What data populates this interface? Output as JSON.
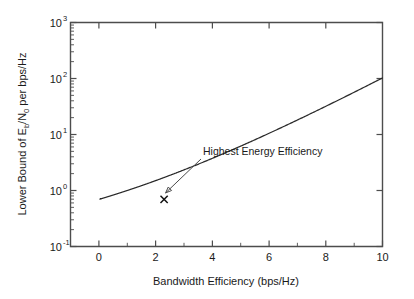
{
  "chart_data": {
    "type": "line",
    "title": "",
    "xlabel": "Bandwidth Efficiency (bps/Hz)",
    "ylabel_parts": {
      "pre": "Lower Bound of E",
      "sub1": "b",
      "mid": "/N",
      "sub2": "0",
      "post": " per bps/Hz"
    },
    "ylabel": "Lower Bound of Eb/N0 per bps/Hz",
    "xscale": "linear",
    "yscale": "log",
    "xlim": [
      -1,
      10
    ],
    "ylim": [
      0.1,
      1000
    ],
    "grid": false,
    "legend": null,
    "xticks": [
      0,
      2,
      4,
      6,
      8,
      10
    ],
    "xticklabels": [
      "0",
      "2",
      "4",
      "6",
      "8",
      "10"
    ],
    "xminorticks": [
      1,
      3,
      5,
      7,
      9
    ],
    "yticks": [
      0.1,
      1,
      10,
      100,
      1000
    ],
    "yticklabels": [
      {
        "base": "10",
        "exp": "-1"
      },
      {
        "base": "10",
        "exp": "0"
      },
      {
        "base": "10",
        "exp": "1"
      },
      {
        "base": "10",
        "exp": "2"
      },
      {
        "base": "10",
        "exp": "3"
      }
    ],
    "formula": "Eb/N0 = (2^eta - 1) / eta",
    "x": [
      0.04,
      0.06,
      0.08,
      0.1,
      0.13,
      0.16,
      0.2,
      0.25,
      0.3,
      0.36,
      0.42,
      0.5,
      0.6,
      0.7,
      0.8,
      0.9,
      1.0,
      1.2,
      1.4,
      1.6,
      1.8,
      2.0,
      2.2,
      2.3,
      2.4,
      2.6,
      2.8,
      3.0,
      3.4,
      3.8,
      4.2,
      4.6,
      5.0,
      5.5,
      6.0,
      6.5,
      7.0,
      7.5,
      8.0,
      8.5,
      9.0,
      9.5,
      10.0
    ],
    "y": [
      693.4,
      462.5,
      347.1,
      277.9,
      213.9,
      174.2,
      139.6,
      112.1,
      93.8,
      78.6,
      67.8,
      57.3,
      48.1,
      41.6,
      36.6,
      32.7,
      29.5,
      24.5,
      21.0,
      18.3,
      16.2,
      14.5,
      13.1,
      12.5,
      12.0,
      11.0,
      10.2,
      9.5,
      8.4,
      7.5,
      6.8,
      6.3,
      5.8,
      5.3,
      4.9,
      4.5,
      4.2,
      3.9,
      3.7,
      3.5,
      3.3,
      3.1,
      3.0
    ],
    "min_point": {
      "x": 2.3,
      "y": 0.693,
      "label": "Highest Energy Efficiency",
      "marker": "x"
    },
    "annotation": {
      "text": "Highest Energy Efficiency",
      "points_to_x": 2.3,
      "points_to_y": 0.72
    },
    "curve_color": "#2b2b2b",
    "axis_color": "#4d4d4d"
  },
  "figure": {
    "background": "#ffffff"
  }
}
